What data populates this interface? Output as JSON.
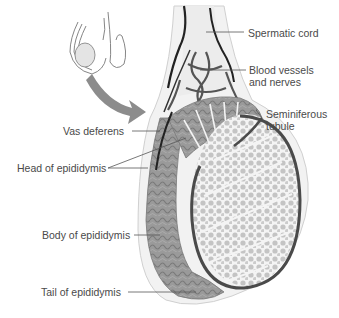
{
  "diagram": {
    "type": "anatomical-illustration",
    "labels": {
      "spermatic_cord": "Spermatic cord",
      "blood_vessels_1": "Blood vessels",
      "blood_vessels_2": "and nerves",
      "seminiferous_1": "Seminiferous",
      "seminiferous_2": "tubule",
      "vas_deferens": "Vas deferens",
      "head_epididymis": "Head of epididymis",
      "body_epididymis": "Body of epididymis",
      "tail_epididymis": "Tail of epididymis"
    },
    "colors": {
      "label_text": "#4a4a4a",
      "leader_line": "#555555",
      "epididymis": "#8a8a8a",
      "tubules": "#c4c4c4",
      "capsule": "#4a4a4a",
      "arrow": "#8c8c8c"
    }
  }
}
